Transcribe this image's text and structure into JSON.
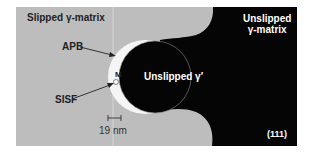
{
  "figure": {
    "labels": {
      "slipped_matrix": "Slipped γ-matrix",
      "unslipped_matrix_line1": "Unslipped",
      "unslipped_matrix_line2": "γ-matrix",
      "unslipped_precipitate": "Unslipped γ′",
      "apb": "APB",
      "sisf": "SISF",
      "m_marker": "M",
      "scale_bar": "19 nm",
      "orientation": "(111)"
    },
    "colors": {
      "slipped_region": "#bdbdbd",
      "unslipped_region": "#050505",
      "fault_ribbon": "#f5f5f5",
      "text_dark": "#222222",
      "text_light": "#ffffff"
    }
  }
}
